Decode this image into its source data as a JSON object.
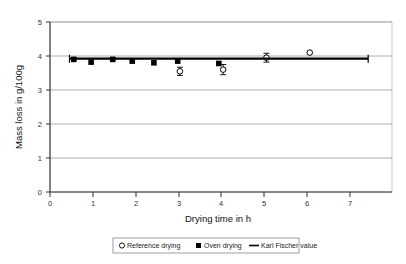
{
  "chart_data": {
    "type": "scatter",
    "title": "",
    "xlabel": "Drying time in h",
    "ylabel": "Mass loss in g/100g",
    "xlim": [
      0,
      7.9
    ],
    "ylim": [
      0,
      5
    ],
    "xticks": [
      0,
      1,
      2,
      3,
      4,
      5,
      6,
      7
    ],
    "yticks": [
      0,
      1,
      2,
      3,
      4,
      5
    ],
    "xtick_labels": [
      "0",
      "1",
      "2",
      "3",
      "4",
      "5",
      "6",
      "7"
    ],
    "ytick_labels": [
      "0",
      "1",
      "2",
      "3",
      "4",
      "5"
    ],
    "grid": "horizontal",
    "legend_position": "below",
    "series": [
      {
        "name": "Reference drying",
        "marker": "open-circle",
        "has_error_bars": true,
        "points": [
          {
            "x": 3.0,
            "y": 3.55,
            "yerr": 0.12
          },
          {
            "x": 4.0,
            "y": 3.6,
            "yerr": 0.15
          },
          {
            "x": 5.0,
            "y": 3.95,
            "yerr": 0.13
          },
          {
            "x": 6.0,
            "y": 4.1,
            "yerr": 0.0
          }
        ]
      },
      {
        "name": "Oven drying",
        "marker": "filled-square",
        "has_error_bars": false,
        "points": [
          {
            "x": 0.55,
            "y": 3.9
          },
          {
            "x": 0.95,
            "y": 3.82
          },
          {
            "x": 1.45,
            "y": 3.9
          },
          {
            "x": 1.9,
            "y": 3.85
          },
          {
            "x": 2.4,
            "y": 3.8
          },
          {
            "x": 2.95,
            "y": 3.85
          },
          {
            "x": 3.9,
            "y": 3.78
          }
        ]
      },
      {
        "name": "Karl Fischer value",
        "marker": "line",
        "has_error_bars": false,
        "value": 3.92,
        "x_start": 0.45,
        "x_end": 7.35
      }
    ]
  },
  "legend": {
    "entries": [
      {
        "label": "Reference drying",
        "symbol": "open-circle"
      },
      {
        "label": "Oven drying",
        "symbol": "filled-square"
      },
      {
        "label": "Karl Fischer value",
        "symbol": "line"
      }
    ]
  },
  "colors": {
    "series_marker": "#000000",
    "karl_fischer_line": "#000000",
    "gridline": "#808080",
    "axis": "#000000",
    "frame": "#b0b0b0",
    "background": "#ffffff"
  }
}
